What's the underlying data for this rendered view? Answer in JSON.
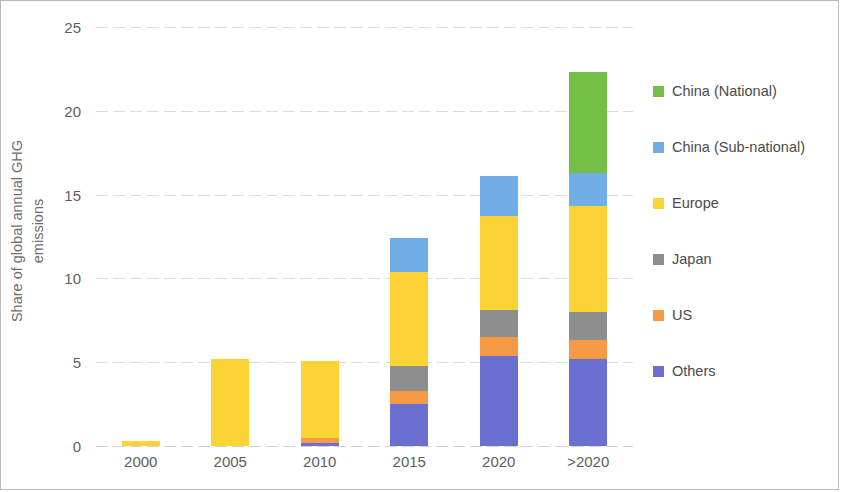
{
  "chart_data": {
    "type": "bar",
    "subtype": "stacked-column",
    "title": "",
    "xlabel": "",
    "ylabel": "Share of global annual GHG emissions",
    "ylabel_lines": [
      "Share of global annual GHG",
      "emissions"
    ],
    "categories": [
      "2000",
      "2005",
      "2010",
      "2015",
      "2020",
      ">2020"
    ],
    "ylim": [
      0,
      25
    ],
    "yticks": [
      0,
      5,
      10,
      15,
      20,
      25
    ],
    "ytick_labels": [
      "0",
      "5",
      "10",
      "15",
      "20",
      "25"
    ],
    "grid": "horizontal-dotted",
    "legend_position": "right",
    "stack_order_bottom_to_top": [
      "Others",
      "US",
      "Japan",
      "Europe",
      "China (Sub-national)",
      "China (National)"
    ],
    "series": [
      {
        "name": "Others",
        "color": "#6b6fd0",
        "values": [
          0,
          0,
          0.2,
          2.5,
          5.4,
          5.2
        ]
      },
      {
        "name": "US",
        "color": "#f79a45",
        "values": [
          0,
          0,
          0.3,
          0.8,
          1.1,
          1.1
        ]
      },
      {
        "name": "Japan",
        "color": "#8e8e8e",
        "values": [
          0,
          0,
          0,
          1.5,
          1.6,
          1.7
        ]
      },
      {
        "name": "Europe",
        "color": "#fcd334",
        "values": [
          0.3,
          5.2,
          4.6,
          5.6,
          5.6,
          6.3
        ]
      },
      {
        "name": "China (Sub-national)",
        "color": "#71aee8",
        "values": [
          0,
          0,
          0,
          2.0,
          2.4,
          2.0
        ]
      },
      {
        "name": "China (National)",
        "color": "#74bf46",
        "values": [
          0,
          0,
          0,
          0,
          0,
          6.0
        ]
      }
    ],
    "totals": [
      0.3,
      5.2,
      5.1,
      12.4,
      16.1,
      22.3
    ]
  },
  "legend": {
    "items": [
      {
        "label": "China (National)",
        "color": "#74bf46"
      },
      {
        "label": "China (Sub-national)",
        "color": "#71aee8"
      },
      {
        "label": "Europe",
        "color": "#fcd334"
      },
      {
        "label": "Japan",
        "color": "#8e8e8e"
      },
      {
        "label": "US",
        "color": "#f79a45"
      },
      {
        "label": "Others",
        "color": "#6b6fd0"
      }
    ]
  }
}
